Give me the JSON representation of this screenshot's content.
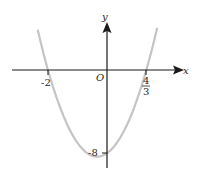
{
  "figure": {
    "type": "parabola-graph",
    "equation": "y = 3x^2 + 2x - 8",
    "axis_labels": {
      "x": "x",
      "y": "y",
      "origin": "O"
    },
    "x_intercepts": [
      {
        "label": "-2",
        "value": -2
      },
      {
        "label_num": "4",
        "label_den": "3",
        "value": 1.3333
      }
    ],
    "y_intercept": {
      "label": "-8",
      "value": -8
    },
    "colors": {
      "axes": "#1a1a1a",
      "curve": "#c0c0c0",
      "text": "#222222"
    }
  }
}
